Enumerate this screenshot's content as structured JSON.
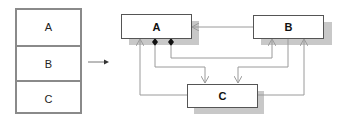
{
  "stack": {
    "cells": [
      {
        "label": "A"
      },
      {
        "label": "B"
      },
      {
        "label": "C"
      }
    ]
  },
  "diagram": {
    "nodes": [
      {
        "id": "A",
        "label": "A"
      },
      {
        "id": "B",
        "label": "B"
      },
      {
        "id": "C",
        "label": "C"
      }
    ],
    "edges": [
      {
        "from": "B",
        "to": "A",
        "type": "arrow"
      },
      {
        "from": "A",
        "to": "C",
        "type": "composition-arrow"
      },
      {
        "from": "A",
        "to": "B",
        "type": "composition-arrow"
      },
      {
        "from": "C",
        "to": "A",
        "type": "arrow"
      },
      {
        "from": "B",
        "to": "C",
        "type": "arrow"
      },
      {
        "from": "C",
        "to": "B",
        "type": "arrow"
      }
    ],
    "colors": {
      "box_border": "#555555",
      "shadow": "#c8c8c8",
      "line": "#9a9a9a",
      "diamond": "#111111"
    }
  },
  "transition_arrow": {
    "direction": "right"
  }
}
